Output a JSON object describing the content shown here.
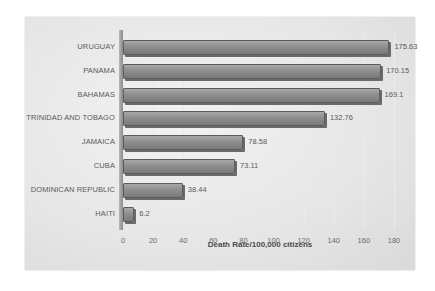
{
  "chart_data": {
    "type": "bar",
    "orientation": "horizontal",
    "title": "",
    "xlabel": "Death Rate/100,000 citizens",
    "ylabel": "",
    "categories": [
      "URUGUAY",
      "PANAMA",
      "BAHAMAS",
      "TRINIDAD AND TOBAGO",
      "JAMAICA",
      "CUBA",
      "DOMINICAN REPUBLIC",
      "HAITI"
    ],
    "values": [
      175.63,
      170.15,
      169.1,
      132.76,
      78.58,
      73.11,
      38.44,
      6.2
    ],
    "value_labels": [
      "175.63",
      "170.15",
      "169.1",
      "132.76",
      "78.58",
      "73.11",
      "38.44",
      "6.2"
    ],
    "xlim": [
      0,
      180
    ],
    "xticks": [
      "0",
      "20",
      "40",
      "60",
      "80",
      "100",
      "120",
      "140",
      "160",
      "180"
    ],
    "grid": true,
    "legend": "none",
    "style": "3d grayscale bars",
    "bar_color": "#8e8e8e",
    "background_color": "#e8e8e8"
  }
}
